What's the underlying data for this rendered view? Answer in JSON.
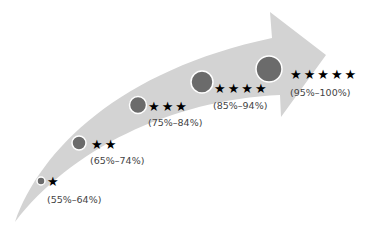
{
  "colors": {
    "arrow": "#d3d3d3",
    "circle_fill": "#6b6b6b",
    "circle_stroke": "#ffffff",
    "star": "#000000",
    "label": "#444444"
  },
  "levels": [
    {
      "stars": "★",
      "star_count": 1,
      "label": "(55%–64%)"
    },
    {
      "stars": "★★",
      "star_count": 2,
      "label": "(65%–74%)"
    },
    {
      "stars": "★★★",
      "star_count": 3,
      "label": "(75%–84%)"
    },
    {
      "stars": "★★★★",
      "star_count": 4,
      "label": "(85%–94%)"
    },
    {
      "stars": "★★★★★",
      "star_count": 5,
      "label": "(95%–100%)"
    }
  ]
}
